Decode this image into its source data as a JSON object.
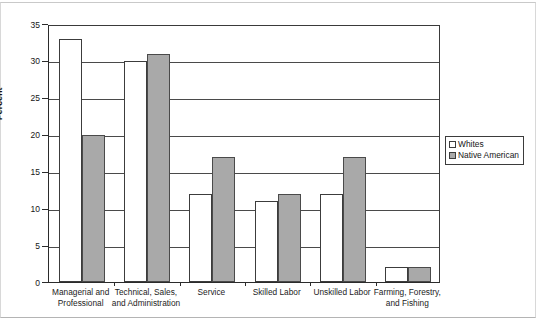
{
  "chart_data": {
    "type": "bar",
    "title": "",
    "xlabel": "",
    "ylabel": "Percent",
    "ylim": [
      0,
      35
    ],
    "yticks": [
      "0",
      "5",
      "10",
      "15",
      "20",
      "25",
      "30",
      "35"
    ],
    "grid": true,
    "legend_position": "right",
    "categories": [
      "Managerial and Professional",
      "Technical, Sales, and Administration",
      "Service",
      "Skilled Labor",
      "Unskilled Labor",
      "Farming, Forestry, and Fishing"
    ],
    "category_lines": [
      [
        "Managerial and",
        "Professional"
      ],
      [
        "Technical, Sales,",
        "and Administration"
      ],
      [
        "Service"
      ],
      [
        "Skilled Labor"
      ],
      [
        "Unskilled Labor"
      ],
      [
        "Farming, Forestry,",
        "and Fishing"
      ]
    ],
    "series": [
      {
        "name": "Whites",
        "color": "#ffffff",
        "values": [
          33,
          30,
          12,
          11,
          12,
          2
        ]
      },
      {
        "name": "Native American",
        "color": "#a9a9a9",
        "values": [
          20,
          31,
          17,
          12,
          17,
          2
        ]
      }
    ]
  },
  "legend": {
    "items": [
      {
        "label": "Whites",
        "swatch": "whites"
      },
      {
        "label": "Native American",
        "swatch": "native"
      }
    ]
  }
}
